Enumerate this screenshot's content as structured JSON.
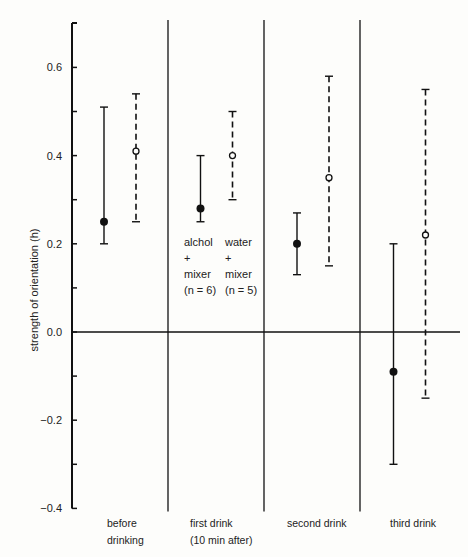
{
  "chart_data": {
    "type": "errorbar",
    "title": "",
    "xlabel": "",
    "ylabel": "strength of orientation (h)",
    "ylim": [
      -0.4,
      0.7
    ],
    "yticks": [
      -0.4,
      -0.2,
      0.0,
      0.2,
      0.4,
      0.6
    ],
    "ytick_labels": [
      "−0.4",
      "−0.2",
      "0.0",
      "0.2",
      "0.4",
      "0.6"
    ],
    "minor_yticks": [
      -0.3,
      -0.1,
      0.1,
      0.3,
      0.5
    ],
    "grid": false,
    "categories": [
      "before drinking",
      "first drink (10 min after)",
      "second drink",
      "third drink"
    ],
    "category_label_lines": [
      [
        "before",
        "drinking"
      ],
      [
        "first drink",
        "(10 min after)"
      ],
      [
        "second drink"
      ],
      [
        "third drink"
      ]
    ],
    "series": [
      {
        "name": "alchol + mixer (n = 6)",
        "style": "solid line, filled circle",
        "values": [
          0.25,
          0.28,
          0.2,
          -0.09
        ],
        "lower": [
          0.2,
          0.25,
          0.13,
          -0.3
        ],
        "upper": [
          0.51,
          0.4,
          0.27,
          0.2
        ]
      },
      {
        "name": "water + mixer (n = 5)",
        "style": "dashed line, open circle",
        "values": [
          0.41,
          0.4,
          0.35,
          0.22
        ],
        "lower": [
          0.25,
          0.3,
          0.15,
          -0.15
        ],
        "upper": [
          0.54,
          0.5,
          0.58,
          0.55
        ]
      }
    ],
    "annotations": [
      {
        "lines": [
          "alchol",
          "+",
          "mixer",
          "(n = 6)"
        ],
        "position": "first drink panel, under solid bar"
      },
      {
        "lines": [
          "water",
          "+",
          "mixer",
          "(n = 5)"
        ],
        "position": "first drink panel, under dashed bar"
      }
    ],
    "reference_line": 0.0,
    "legend_position": "inline annotation in second panel"
  }
}
